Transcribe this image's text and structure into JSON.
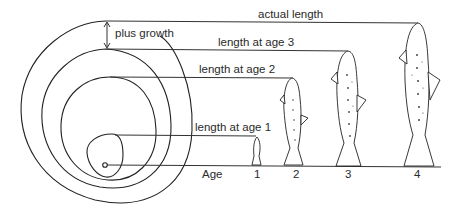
{
  "diagram": {
    "labels": {
      "actual_length": "actual length",
      "age3": "length at age 3",
      "age2": "length at age 2",
      "age1": "length at age 1",
      "plus_growth": "plus growth",
      "age_axis": "Age"
    },
    "ages": [
      "1",
      "2",
      "3",
      "4"
    ],
    "colors": {
      "line": "#333333",
      "background": "#ffffff"
    }
  }
}
